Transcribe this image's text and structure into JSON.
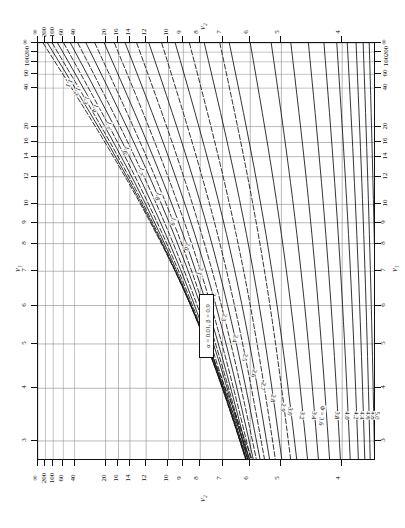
{
  "chart_data": {
    "type": "line",
    "annotation": "α = 0.01, β = 0.9",
    "axis_titles": {
      "nu1": "ν₁",
      "nu2": "ν₂"
    },
    "axes": {
      "left": {
        "label": "ν₁",
        "ticks": [
          "∞",
          "200",
          "100",
          "60",
          "40",
          "20",
          "16",
          "14",
          "12",
          "10",
          "9",
          "8",
          "7",
          "6",
          "5",
          "4",
          "3"
        ]
      },
      "right": {
        "label": "ν₁",
        "ticks": [
          "∞",
          "200",
          "100",
          "60",
          "40",
          "20",
          "16",
          "14",
          "12",
          "10",
          "9",
          "8",
          "7",
          "6",
          "5",
          "4",
          "3"
        ]
      },
      "top": {
        "label": "ν₂",
        "ticks": [
          "∞",
          "200",
          "100",
          "60",
          "40",
          "20",
          "16",
          "14",
          "12",
          "10",
          "9",
          "8",
          "7",
          "6",
          "5",
          "4"
        ]
      },
      "bottom": {
        "label": "ν₂",
        "ticks": [
          "∞",
          "200",
          "100",
          "60",
          "40",
          "20",
          "16",
          "14",
          "12",
          "10",
          "9",
          "8",
          "7",
          "6",
          "5",
          "4"
        ]
      },
      "grid": "on"
    },
    "phi_prefix": "Φ =",
    "phi_labeled_value": "3.6",
    "phi_curves": [
      "1.1",
      "1.2",
      "1.3",
      "1.4",
      "1.5",
      "1.6",
      "1.7",
      "1.8",
      "1.9",
      "2.0",
      "2.1",
      "2.2",
      "2.3",
      "2.4",
      "2.5",
      "2.6",
      "2.7",
      "2.8",
      "2.9",
      "3.0",
      "3.2",
      "3.4",
      "3.6",
      "3.8",
      "4.0",
      "4.2",
      "4.4",
      "4.6",
      "4.8",
      "5.0"
    ],
    "nu1_tick_positions": [
      0,
      0.022,
      0.045,
      0.075,
      0.108,
      0.2,
      0.238,
      0.272,
      0.32,
      0.386,
      0.43,
      0.48,
      0.546,
      0.628,
      0.72,
      0.826,
      0.952
    ],
    "nu2_tick_positions": [
      0,
      0.022,
      0.045,
      0.075,
      0.108,
      0.2,
      0.238,
      0.272,
      0.32,
      0.386,
      0.43,
      0.48,
      0.546,
      0.628,
      0.72,
      0.9
    ],
    "phi_curve_x": [
      0.015,
      0.028,
      0.042,
      0.058,
      0.076,
      0.096,
      0.118,
      0.142,
      0.168,
      0.196,
      0.226,
      0.258,
      0.292,
      0.328,
      0.366,
      0.406,
      0.448,
      0.492,
      0.538,
      0.566,
      0.628,
      0.69,
      0.748,
      0.8,
      0.846,
      0.884,
      0.915,
      0.941,
      0.962,
      0.98
    ],
    "phi_curve_slope": [
      0.62,
      0.6,
      0.58,
      0.56,
      0.54,
      0.52,
      0.5,
      0.48,
      0.455,
      0.43,
      0.405,
      0.38,
      0.355,
      0.33,
      0.305,
      0.28,
      0.255,
      0.23,
      0.21,
      0.2,
      0.17,
      0.14,
      0.115,
      0.095,
      0.078,
      0.064,
      0.052,
      0.042,
      0.034,
      0.027
    ],
    "phi_dashed": [
      "1.1",
      "1.3",
      "1.5",
      "1.7",
      "1.9",
      "2.1",
      "2.3",
      "2.5",
      "2.7",
      "2.9"
    ],
    "colors": {
      "curve": "#111111",
      "grid": "#8a8a8a",
      "frame": "#111111",
      "background": "#ffffff"
    }
  },
  "labels": {
    "infinity": "∞"
  }
}
